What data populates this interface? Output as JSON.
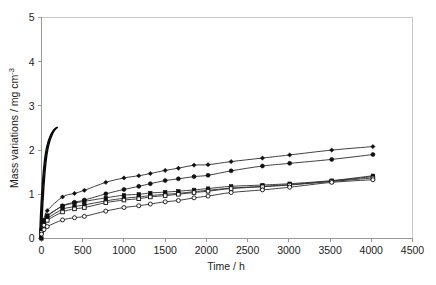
{
  "chart_data": {
    "type": "line",
    "title": "",
    "xlabel": "Time / h",
    "ylabel": "Mass variations / mg cm",
    "ylabel_superscript": "-3",
    "ylabel_full": "Mass variations / mg cm-3",
    "xlim": [
      0,
      4500
    ],
    "ylim": [
      0,
      5
    ],
    "xticks": [
      0,
      500,
      1000,
      1500,
      2000,
      2500,
      3000,
      3500,
      4000,
      4500
    ],
    "xtick_labels": [
      "0",
      "500",
      "1000",
      "1500",
      "2000",
      "2500",
      "3000",
      "3500",
      "4000",
      "4500"
    ],
    "yticks": [
      0,
      1,
      2,
      3,
      4,
      5
    ],
    "ytick_labels": [
      "0",
      "1",
      "2",
      "3",
      "4",
      "5"
    ],
    "grid": false,
    "legend": "none",
    "line_color": "#2b2b2b",
    "marker_fill_color": "#101010",
    "marker_open_color": "#ffffff",
    "axis_color": "#9a9a9a",
    "frame_color": "#c9c9c9",
    "series": [
      {
        "name": "Steep early-stage curve",
        "marker": "none",
        "x": [
          0,
          10,
          25,
          45,
          70,
          100,
          130,
          160,
          185,
          200
        ],
        "values": [
          0.0,
          0.55,
          1.05,
          1.55,
          1.95,
          2.2,
          2.35,
          2.45,
          2.5,
          2.52
        ]
      },
      {
        "name": "Series A (filled diamond, upper)",
        "marker": "filled-diamond",
        "x": [
          0,
          30,
          70,
          255,
          400,
          520,
          780,
          1000,
          1180,
          1320,
          1500,
          1660,
          1850,
          2020,
          2300,
          2680,
          3010,
          3520,
          4020
        ],
        "values": [
          0.19,
          0.42,
          0.63,
          0.94,
          1.02,
          1.09,
          1.27,
          1.37,
          1.42,
          1.47,
          1.54,
          1.59,
          1.66,
          1.67,
          1.74,
          1.82,
          1.89,
          2.0,
          2.08
        ]
      },
      {
        "name": "Series B (filled circle, second)",
        "marker": "filled-circle",
        "x": [
          0,
          30,
          70,
          255,
          400,
          520,
          780,
          1000,
          1180,
          1320,
          1500,
          1660,
          1850,
          2020,
          2300,
          2680,
          3010,
          3520,
          4020
        ],
        "values": [
          0.17,
          0.36,
          0.5,
          0.74,
          0.82,
          0.87,
          1.01,
          1.11,
          1.18,
          1.24,
          1.31,
          1.35,
          1.4,
          1.43,
          1.53,
          1.64,
          1.7,
          1.79,
          1.9
        ]
      },
      {
        "name": "Series C (filled square, cluster)",
        "marker": "filled-square",
        "x": [
          0,
          30,
          70,
          255,
          400,
          520,
          780,
          1000,
          1180,
          1320,
          1500,
          1660,
          1850,
          2020,
          2300,
          2680,
          3010,
          3520,
          4020
        ],
        "values": [
          0.2,
          0.4,
          0.52,
          0.73,
          0.8,
          0.84,
          0.92,
          0.98,
          1.0,
          1.03,
          1.05,
          1.07,
          1.1,
          1.13,
          1.18,
          1.21,
          1.24,
          1.31,
          1.42
        ]
      },
      {
        "name": "Series D (filled square, cluster lower)",
        "marker": "filled-square",
        "x": [
          0,
          30,
          70,
          255,
          400,
          520,
          780,
          1000,
          1180,
          1320,
          1500,
          1660,
          1850,
          2020,
          2300,
          2680,
          3010,
          3520,
          4020
        ],
        "values": [
          0.16,
          0.33,
          0.45,
          0.66,
          0.72,
          0.76,
          0.85,
          0.91,
          0.94,
          0.97,
          1.0,
          1.02,
          1.06,
          1.09,
          1.14,
          1.18,
          1.22,
          1.3,
          1.4
        ]
      },
      {
        "name": "Series E (open square)",
        "marker": "open-square",
        "x": [
          0,
          30,
          70,
          255,
          400,
          520,
          780,
          1000,
          1180,
          1320,
          1500,
          1660,
          1850,
          2020,
          2300,
          2680,
          3010,
          3520,
          4020
        ],
        "values": [
          0.14,
          0.3,
          0.41,
          0.6,
          0.67,
          0.7,
          0.81,
          0.87,
          0.9,
          0.94,
          0.97,
          1.0,
          1.04,
          1.07,
          1.13,
          1.17,
          1.21,
          1.29,
          1.37
        ]
      },
      {
        "name": "Series F (open circle, lowest)",
        "marker": "open-circle",
        "x": [
          0,
          30,
          70,
          255,
          400,
          520,
          780,
          1000,
          1180,
          1320,
          1500,
          1660,
          1850,
          2020,
          2300,
          2680,
          3010,
          3520,
          4020
        ],
        "values": [
          0.1,
          0.2,
          0.27,
          0.42,
          0.47,
          0.5,
          0.62,
          0.7,
          0.74,
          0.78,
          0.83,
          0.86,
          0.92,
          0.96,
          1.04,
          1.1,
          1.16,
          1.27,
          1.33
        ]
      },
      {
        "name": "Origin marker",
        "marker": "filled-square",
        "x": [
          0
        ],
        "values": [
          0.0
        ]
      }
    ]
  }
}
